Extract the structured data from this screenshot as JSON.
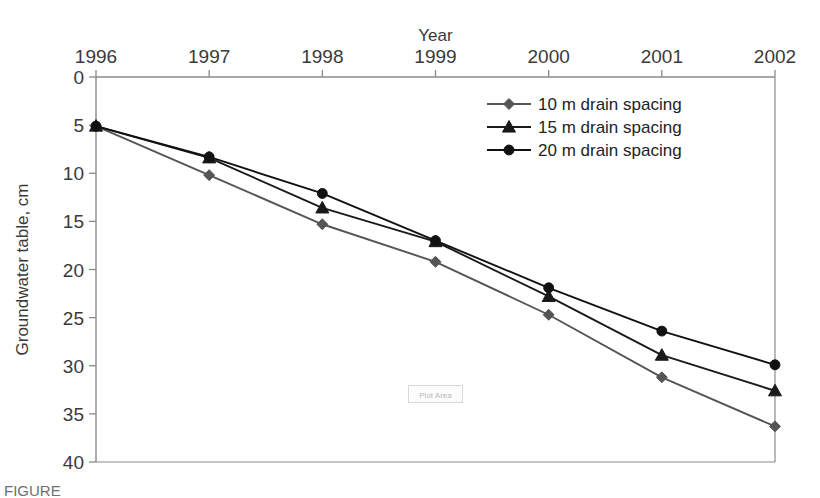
{
  "chart_data": {
    "type": "line",
    "title": "",
    "xlabel": "Year",
    "ylabel": "Groundwater table, cm",
    "categories": [
      "1996",
      "1997",
      "1998",
      "1999",
      "2000",
      "2001",
      "2002"
    ],
    "x": [
      1996,
      1997,
      1998,
      1999,
      2000,
      2001,
      2002
    ],
    "xlim": [
      1996,
      2002
    ],
    "ylim": [
      0,
      40
    ],
    "y_inverted": true,
    "y_ticks": [
      "0",
      "5",
      "10",
      "15",
      "20",
      "25",
      "30",
      "35",
      "40"
    ],
    "y_tick_values": [
      0,
      5,
      10,
      15,
      20,
      25,
      30,
      35,
      40
    ],
    "x_axis_position": "top",
    "grid": false,
    "legend_position": "top-right-inside",
    "series": [
      {
        "name": "10 m drain spacing",
        "marker": "diamond",
        "color": "#555555",
        "values": [
          5.1,
          10.2,
          15.3,
          19.2,
          24.7,
          31.2,
          36.3
        ]
      },
      {
        "name": "15 m drain spacing",
        "marker": "triangle",
        "color": "#1a1a1a",
        "values": [
          5.1,
          8.4,
          13.6,
          17.1,
          22.8,
          28.9,
          32.6
        ]
      },
      {
        "name": "20 m drain spacing",
        "marker": "circle",
        "color": "#111111",
        "values": [
          5.1,
          8.3,
          12.1,
          17.0,
          21.9,
          26.4,
          29.9
        ]
      }
    ],
    "annotations": [
      {
        "text": "Plot Area",
        "x": 1999,
        "y": 33.0
      }
    ]
  },
  "caption": {
    "text": "FIGURE"
  },
  "colors": {
    "axis": "#8a8a8a",
    "text": "#3a3a3a",
    "series_10m": "#555555",
    "series_15m": "#1a1a1a",
    "series_20m": "#111111",
    "background": "#ffffff"
  }
}
